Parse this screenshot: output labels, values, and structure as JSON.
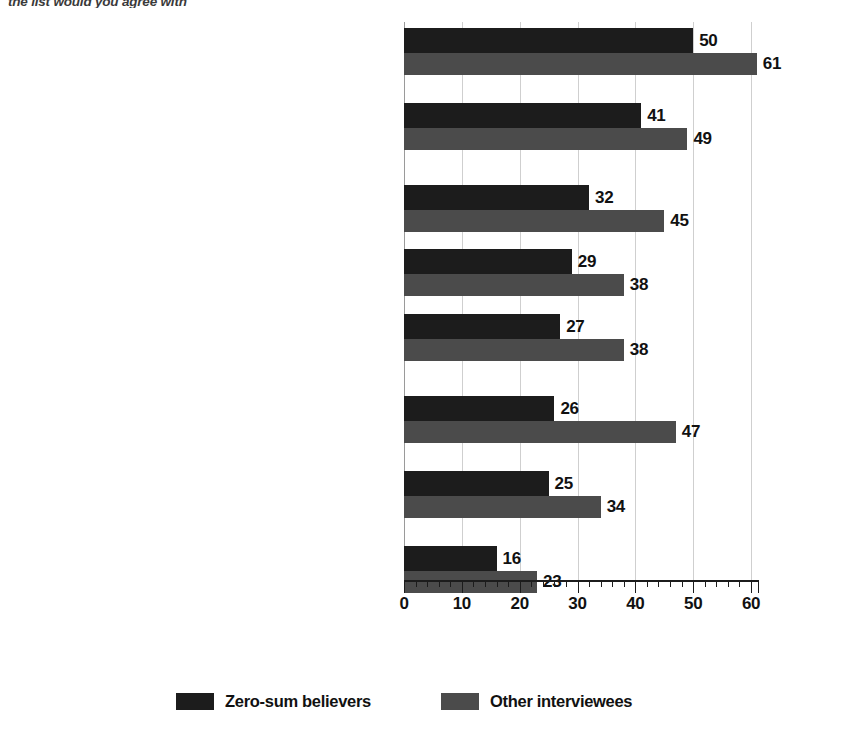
{
  "question": {
    "text": "the list would you agree with"
  },
  "chart_data": {
    "type": "bar",
    "orientation": "horizontal",
    "title": "",
    "subtitle": "",
    "xlabel": "",
    "ylabel": "",
    "xlim": [
      0,
      61
    ],
    "xticks": [
      0,
      10,
      20,
      30,
      40,
      50,
      60
    ],
    "xtick_labels": [
      "0",
      "10",
      "20",
      "30",
      "40",
      "50",
      "60"
    ],
    "minor_tick_step": 2,
    "grid": true,
    "grid_axis": "x",
    "legend_position": "bottom",
    "categories": [
      "Rich people who have succeeded through their own efforts are role models who motivate me",
      "When it comes to getting rich, the decisive factor is how good you are at establishing important connections and contacts",
      "Many rich people become rich because they take more risks than others tend to",
      "Becoming rich primarily depends on what abilities and ideas you have",
      "Society as a whole benefits from the existence of rich people, as many of them are entrepreneurs who created new products",
      "Rich people are generally very industrious throughout their lives",
      "Society as a whole benefits from the existence of rich people because many of them create jobs",
      "Society as a whole benefits from the existence of rich people because they pay high taxes"
    ],
    "category_lines": [
      [
        "Rich people who have succeeded through their",
        "own efforts are role models who motivate me"
      ],
      [
        "When it comes to getting rich, the decisive",
        "factor is how good you are at establishing",
        "important connections and contacts"
      ],
      [
        "Many rich people become rich because",
        "they take more risks than others tend to"
      ],
      [
        "Becoming rich primarily depends",
        "on what abilities and ideas you have"
      ],
      [
        "Society as a whole benefits from the existence",
        "of rich people, as many of them are",
        "entrepreneurs who created new products"
      ],
      [
        "Rich people are generally very",
        "industrious throughout their lives"
      ],
      [
        "Society as a whole benefits from the existence of",
        "rich people because many of them create jobs"
      ],
      [
        "Society as a whole benefits from the existence",
        "of rich people because they pay high taxes"
      ]
    ],
    "series": [
      {
        "name": "Zero-sum believers",
        "color": "#1c1c1c",
        "values": [
          50,
          41,
          32,
          29,
          27,
          26,
          25,
          16
        ]
      },
      {
        "name": "Other interviewees",
        "color": "#4b4b4b",
        "values": [
          61,
          49,
          45,
          38,
          38,
          47,
          34,
          23
        ]
      }
    ]
  },
  "legend": {
    "items": [
      {
        "label": "Zero-sum believers",
        "color": "#1c1c1c"
      },
      {
        "label": "Other interviewees",
        "color": "#4b4b4b"
      }
    ]
  }
}
